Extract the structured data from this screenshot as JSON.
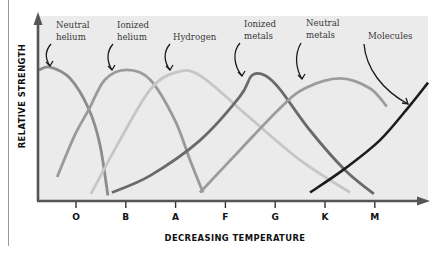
{
  "chart_data": {
    "type": "line",
    "title": "",
    "xlabel": "DECREASING TEMPERATURE",
    "ylabel": "RELATIVE STRENGTH",
    "categories": [
      "O",
      "B",
      "A",
      "F",
      "G",
      "K",
      "M"
    ],
    "x_index_note": "x is spectral class index: O=0, B=1, A=2, F=3, G=4, K=5, M=6",
    "xlim": [
      -0.77,
      7.1
    ],
    "ylim": [
      0,
      1.0
    ],
    "grid": false,
    "legend": "none (curves labeled directly with arrows)",
    "series": [
      {
        "name": "Neutral helium",
        "color": "#8c8c8c",
        "points": [
          [
            -0.74,
            0.93
          ],
          [
            -0.52,
            0.95
          ],
          [
            -0.12,
            0.87
          ],
          [
            0.26,
            0.65
          ],
          [
            0.48,
            0.4
          ],
          [
            0.64,
            0.04
          ]
        ],
        "label_anchor": [
          -0.52,
          0.95
        ]
      },
      {
        "name": "Ionized helium",
        "color": "#9a9a9a",
        "points": [
          [
            -0.38,
            0.17
          ],
          [
            -0.02,
            0.47
          ],
          [
            0.26,
            0.65
          ],
          [
            0.58,
            0.86
          ],
          [
            1.02,
            0.93
          ],
          [
            1.49,
            0.86
          ],
          [
            1.99,
            0.57
          ],
          [
            2.29,
            0.29
          ],
          [
            2.55,
            0.06
          ]
        ],
        "label_anchor": [
          0.8,
          0.91
        ]
      },
      {
        "name": "Hydrogen",
        "color": "#c6c6c6",
        "points": [
          [
            0.3,
            0.05
          ],
          [
            0.88,
            0.43
          ],
          [
            1.49,
            0.79
          ],
          [
            1.99,
            0.91
          ],
          [
            2.49,
            0.89
          ],
          [
            3.49,
            0.59
          ],
          [
            4.5,
            0.29
          ],
          [
            5.5,
            0.06
          ]
        ],
        "label_anchor": [
          1.85,
          0.9
        ]
      },
      {
        "name": "Ionized metals",
        "color": "#6a6a6a",
        "points": [
          [
            0.72,
            0.06
          ],
          [
            1.49,
            0.18
          ],
          [
            2.49,
            0.43
          ],
          [
            3.29,
            0.74
          ],
          [
            3.53,
            0.89
          ],
          [
            3.8,
            0.89
          ],
          [
            4.1,
            0.79
          ],
          [
            4.7,
            0.5
          ],
          [
            5.4,
            0.22
          ],
          [
            5.98,
            0.05
          ]
        ],
        "label_anchor": [
          3.5,
          0.88
        ]
      },
      {
        "name": "Neutral metals",
        "color": "#9c9c9c",
        "points": [
          [
            2.49,
            0.06
          ],
          [
            3.29,
            0.36
          ],
          [
            4.1,
            0.66
          ],
          [
            4.6,
            0.8
          ],
          [
            5.3,
            0.87
          ],
          [
            5.9,
            0.8
          ],
          [
            6.24,
            0.67
          ]
        ],
        "label_anchor": [
          4.8,
          0.82
        ]
      },
      {
        "name": "Molecules",
        "color": "#1c1c1c",
        "points": [
          [
            4.7,
            0.06
          ],
          [
            5.4,
            0.23
          ],
          [
            6.1,
            0.43
          ],
          [
            6.71,
            0.68
          ],
          [
            7.07,
            0.84
          ]
        ],
        "label_anchor": [
          6.8,
          0.72
        ]
      }
    ],
    "annotations": [
      {
        "text_lines": [
          "Neutral",
          "helium"
        ],
        "points_to": "Neutral helium"
      },
      {
        "text_lines": [
          "Ionized",
          "helium"
        ],
        "points_to": "Ionized helium"
      },
      {
        "text_lines": [
          "Hydrogen"
        ],
        "points_to": "Hydrogen"
      },
      {
        "text_lines": [
          "Ionized",
          "metals"
        ],
        "points_to": "Ionized metals"
      },
      {
        "text_lines": [
          "Neutral",
          "metals"
        ],
        "points_to": "Neutral metals"
      },
      {
        "text_lines": [
          "Molecules"
        ],
        "points_to": "Molecules"
      }
    ],
    "colors": {
      "panel_background": "#ebebeb",
      "axis": "#555555",
      "arrow": "#1a1a1a"
    }
  }
}
